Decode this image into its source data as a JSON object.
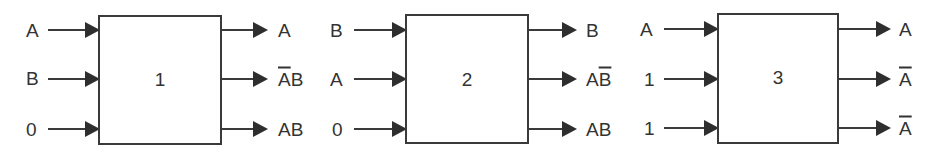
{
  "diagram": {
    "type": "block diagram of three reversible logic gates",
    "blocks": [
      {
        "id": "1",
        "label": "1",
        "inputs": [
          "A",
          "B",
          "0"
        ],
        "outputs": [
          {
            "text": "A",
            "parts": [
              {
                "t": "A",
                "over": false
              }
            ]
          },
          {
            "text": "A̅B",
            "parts": [
              {
                "t": "A",
                "over": true
              },
              {
                "t": "B",
                "over": false
              }
            ]
          },
          {
            "text": "AB",
            "parts": [
              {
                "t": "AB",
                "over": false
              }
            ]
          }
        ]
      },
      {
        "id": "2",
        "label": "2",
        "inputs": [
          "B",
          "A",
          "0"
        ],
        "outputs": [
          {
            "text": "B",
            "parts": [
              {
                "t": "B",
                "over": false
              }
            ]
          },
          {
            "text": "AB̅",
            "parts": [
              {
                "t": "A",
                "over": false
              },
              {
                "t": "B",
                "over": true
              }
            ]
          },
          {
            "text": "AB",
            "parts": [
              {
                "t": "AB",
                "over": false
              }
            ]
          }
        ]
      },
      {
        "id": "3",
        "label": "3",
        "inputs": [
          "A",
          "1",
          "1"
        ],
        "outputs": [
          {
            "text": "A",
            "parts": [
              {
                "t": "A",
                "over": false
              }
            ]
          },
          {
            "text": "A̅",
            "parts": [
              {
                "t": "A",
                "over": true
              }
            ]
          },
          {
            "text": "A̅",
            "parts": [
              {
                "t": "A",
                "over": true
              }
            ]
          }
        ]
      }
    ],
    "colors": {
      "line": "#3a3a3a",
      "text": "#333333",
      "background": "#ffffff"
    }
  }
}
